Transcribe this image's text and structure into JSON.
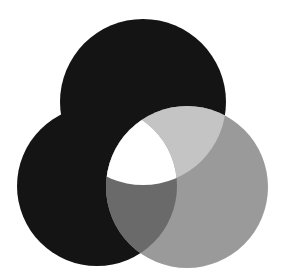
{
  "diagram": {
    "type": "three-circle-venn",
    "background": "#ffffff",
    "circles": [
      {
        "name": "top",
        "cx": 143,
        "cy": 102,
        "r": 83
      },
      {
        "name": "left",
        "cx": 97,
        "cy": 186,
        "r": 80
      },
      {
        "name": "right",
        "cx": 187,
        "cy": 187,
        "r": 81
      }
    ],
    "region_colors": {
      "top_only": "#141414",
      "left_only": "#141414",
      "right_only": "#9a9a9a",
      "top_left": "#141414",
      "top_right": "#c4c4c4",
      "left_right": "#6a6a6a",
      "all_three": "#ffffff"
    }
  }
}
